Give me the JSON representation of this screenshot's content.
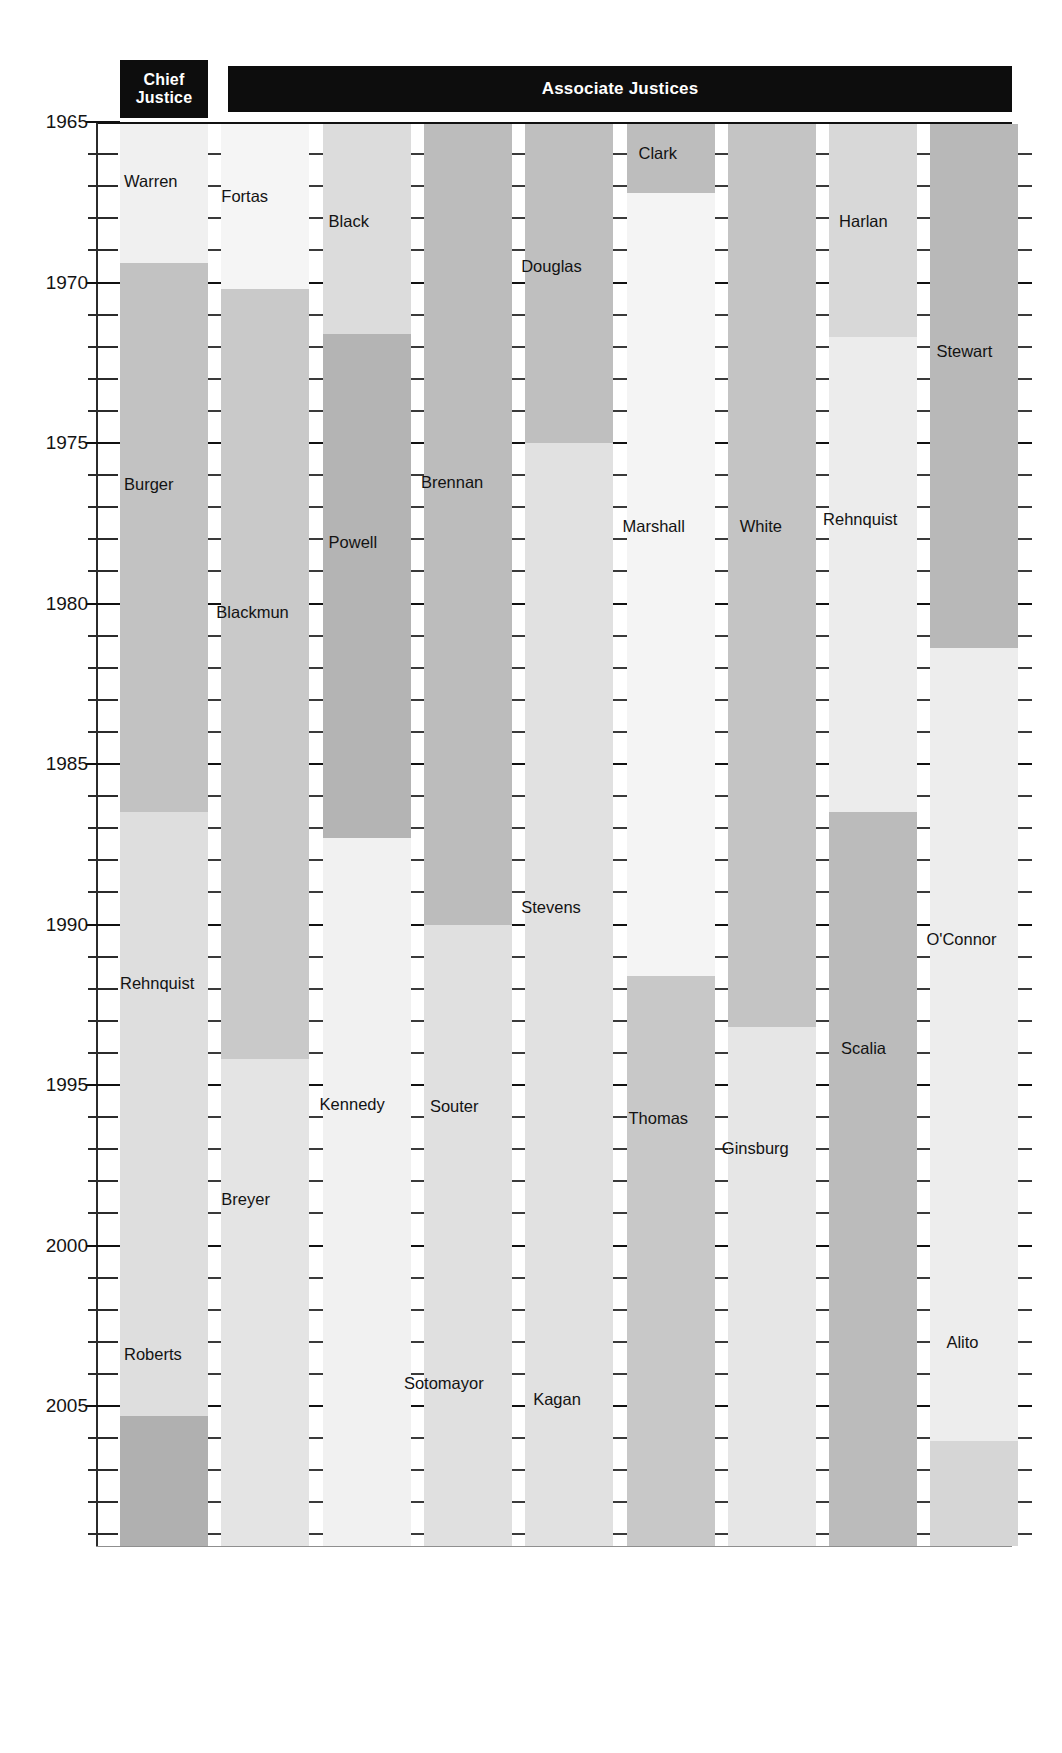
{
  "chart_data": {
    "type": "bar",
    "title": "",
    "subtitle": "",
    "xlabel": "",
    "ylabel": "",
    "orientation": "vertical-timeline",
    "ylim": [
      1965,
      2012
    ],
    "y_axis_direction": "top-to-bottom",
    "grid": false,
    "tick_labels": [
      "1965",
      "1970",
      "1975",
      "1980",
      "1985",
      "1990",
      "1995",
      "2000",
      "2005",
      "2010"
    ],
    "tick_values": [
      1965,
      1970,
      1975,
      1980,
      1985,
      1990,
      1995,
      2000,
      2005,
      2010
    ],
    "minor_tick_interval": 1,
    "legend": [],
    "column_headers": [
      "Chief Justice",
      "Associate Justices"
    ],
    "columns": [
      {
        "header_group": "Chief Justice",
        "seats": [
          {
            "name": "Warren",
            "start": 1965,
            "end": 1969.4,
            "shade": "#f0f0f0"
          },
          {
            "name": "Burger",
            "start": 1969.4,
            "end": 1986.5,
            "shade": "#c2c2c2"
          },
          {
            "name": "Rehnquist",
            "start": 1986.5,
            "end": 2005.3,
            "shade": "#dedede"
          },
          {
            "name": "Roberts",
            "start": 2005.3,
            "end": 2012.0,
            "shade": "#b0b0b0"
          }
        ]
      },
      {
        "header_group": "Associate Justices",
        "seats": [
          {
            "name": "Fortas",
            "start": 1965,
            "end": 1970.2,
            "shade": "#f5f5f5"
          },
          {
            "name": "Blackmun",
            "start": 1970.2,
            "end": 1994.2,
            "shade": "#c9c9c9"
          },
          {
            "name": "Breyer",
            "start": 1994.2,
            "end": 2012.0,
            "shade": "#e4e4e4"
          }
        ]
      },
      {
        "header_group": "Associate Justices",
        "seats": [
          {
            "name": "Black",
            "start": 1965,
            "end": 1971.6,
            "shade": "#dcdcdc"
          },
          {
            "name": "Powell",
            "start": 1971.6,
            "end": 1987.3,
            "shade": "#b4b4b4"
          },
          {
            "name": "Kennedy",
            "start": 1987.3,
            "end": 2012.0,
            "shade": "#f1f1f1"
          }
        ]
      },
      {
        "header_group": "Associate Justices",
        "seats": [
          {
            "name": "Brennan",
            "start": 1965,
            "end": 1990.0,
            "shade": "#bcbcbc"
          },
          {
            "name": "Souter",
            "start": 1990.0,
            "end": 2009.4,
            "shade": "#e0e0e0"
          },
          {
            "name": "Sotomayor",
            "start": 2009.4,
            "end": 2012.0,
            "shade": "#d3d3d3"
          }
        ]
      },
      {
        "header_group": "Associate Justices",
        "seats": [
          {
            "name": "Douglas",
            "start": 1965,
            "end": 1975.0,
            "shade": "#bfbfbf"
          },
          {
            "name": "Stevens",
            "start": 1975.0,
            "end": 2010.2,
            "shade": "#e1e1e1"
          },
          {
            "name": "Kagan",
            "start": 2010.2,
            "end": 2012.0,
            "shade": "#c5c5c5"
          }
        ]
      },
      {
        "header_group": "Associate Justices",
        "seats": [
          {
            "name": "Clark",
            "start": 1965,
            "end": 1967.2,
            "shade": "#bdbdbd"
          },
          {
            "name": "Marshall",
            "start": 1967.2,
            "end": 1991.6,
            "shade": "#f4f4f4"
          },
          {
            "name": "Thomas",
            "start": 1991.6,
            "end": 2012.0,
            "shade": "#c8c8c8"
          }
        ]
      },
      {
        "header_group": "Associate Justices",
        "seats": [
          {
            "name": "White",
            "start": 1965,
            "end": 1993.2,
            "shade": "#c4c4c4"
          },
          {
            "name": "Ginsburg",
            "start": 1993.2,
            "end": 2012.0,
            "shade": "#e6e6e6"
          }
        ]
      },
      {
        "header_group": "Associate Justices",
        "seats": [
          {
            "name": "Harlan",
            "start": 1965,
            "end": 1971.7,
            "shade": "#d8d8d8"
          },
          {
            "name": "Rehnquist",
            "start": 1971.7,
            "end": 1986.5,
            "shade": "#ececec"
          },
          {
            "name": "Scalia",
            "start": 1986.5,
            "end": 2012.0,
            "shade": "#bbbbbb"
          }
        ]
      },
      {
        "header_group": "Associate Justices",
        "seats": [
          {
            "name": "Stewart",
            "start": 1965,
            "end": 1981.4,
            "shade": "#b8b8b8"
          },
          {
            "name": "O'Connor",
            "start": 1981.4,
            "end": 2006.1,
            "shade": "#ededed"
          },
          {
            "name": "Alito",
            "start": 2006.1,
            "end": 2012.0,
            "shade": "#d6d6d6"
          }
        ]
      }
    ]
  },
  "header": {
    "chief_label_line1": "Chief",
    "chief_label_line2": "Justice",
    "associate_label": "Associate Justices"
  },
  "axis": {
    "years": [
      "1965",
      "1970",
      "1975",
      "1980",
      "1985",
      "1990",
      "1995",
      "2000",
      "2005",
      "2010"
    ]
  },
  "artifact": {
    "top_clipped_text": "a slice of partially cropped caption text"
  },
  "colors": {
    "header_bar": "#0d0d0d",
    "header_text": "#ffffff",
    "axis": "#111111",
    "label_text": "#131313",
    "background": "#ffffff"
  }
}
